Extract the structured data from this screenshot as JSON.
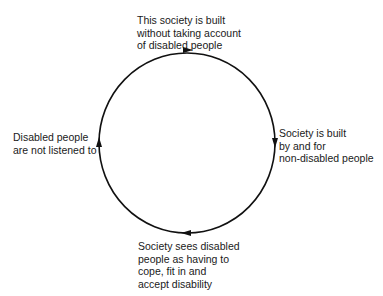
{
  "diagram": {
    "type": "cycle",
    "direction": "clockwise",
    "colors": {
      "stroke": "#111111",
      "text": "#1a1a1a",
      "background": "#ffffff"
    },
    "nodes": [
      {
        "id": "top",
        "lines": [
          "This society is built",
          "without taking account",
          "of disabled people"
        ]
      },
      {
        "id": "right",
        "lines": [
          "Society is built",
          "by and for",
          "non-disabled people"
        ]
      },
      {
        "id": "bottom",
        "lines": [
          "Society sees disabled",
          "people as having to",
          "cope, fit in and",
          "accept disability"
        ]
      },
      {
        "id": "left",
        "lines": [
          "Disabled people",
          "are not listened to"
        ]
      }
    ]
  }
}
